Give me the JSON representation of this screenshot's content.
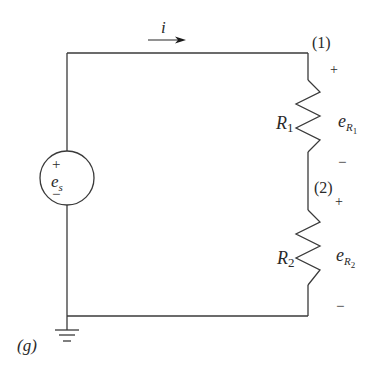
{
  "diagram": {
    "type": "electrical-circuit",
    "current": {
      "symbol": "i",
      "direction": "clockwise (rightward along top wire)"
    },
    "source": {
      "symbol_main": "e",
      "symbol_sub": "s",
      "plus": "+",
      "minus": "−"
    },
    "nodes": {
      "n1": "(1)",
      "n2": "(2)",
      "ground": "(g)"
    },
    "resistors": [
      {
        "name_main": "R",
        "name_sub": "1",
        "voltage_main": "e",
        "voltage_sub": "R",
        "voltage_subsub": "1",
        "plus": "+",
        "minus": "−"
      },
      {
        "name_main": "R",
        "name_sub": "2",
        "voltage_main": "e",
        "voltage_sub": "R",
        "voltage_subsub": "2",
        "plus": "+",
        "minus": "−"
      }
    ],
    "colors": {
      "wire": "#3a3a3a",
      "text": "#2a2a2a",
      "background": "#ffffff"
    }
  }
}
